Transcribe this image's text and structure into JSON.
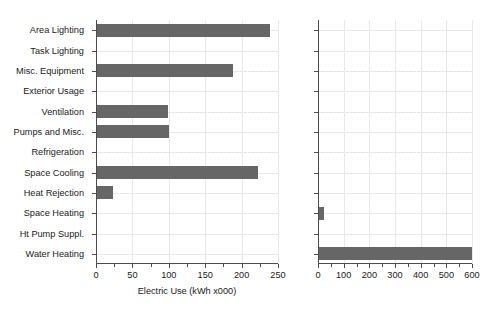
{
  "chart_data": [
    {
      "type": "bar",
      "orientation": "horizontal",
      "title": "",
      "xlabel": "Electric Use (kWh x000)",
      "ylabel": "",
      "categories": [
        "Area Lighting",
        "Task Lighting",
        "Misc. Equipment",
        "Exterior Usage",
        "Ventilation",
        "Pumps and Misc.",
        "Refrigeration",
        "Space Cooling",
        "Heat Rejection",
        "Space Heating",
        "Ht Pump Suppl.",
        "Water Heating"
      ],
      "values": [
        237,
        0,
        187,
        0,
        97,
        99,
        0,
        221,
        22,
        0,
        0,
        0
      ],
      "xlim": [
        0,
        250
      ],
      "xticks": [
        0,
        50,
        100,
        150,
        200,
        250
      ],
      "xtick_labels": [
        "0",
        "50",
        "100",
        "150",
        "200",
        "250"
      ],
      "minor_tick_step": 25,
      "grid": true,
      "bar_color": "#666666"
    },
    {
      "type": "bar",
      "orientation": "horizontal",
      "title": "",
      "xlabel": "Fuel Use (Btu x000,000)",
      "ylabel": "",
      "categories": [
        "Area Lighting",
        "Task Lighting",
        "Misc. Equipment",
        "Exterior Usage",
        "Ventilation",
        "Pumps and Misc.",
        "Refrigeration",
        "Space Cooling",
        "Heat Rejection",
        "Space Heating",
        "Ht Pump Suppl.",
        "Water Heating"
      ],
      "values": [
        0,
        0,
        0,
        0,
        0,
        0,
        0,
        0,
        0,
        20,
        0,
        597
      ],
      "xlim": [
        0,
        600
      ],
      "xticks": [
        0,
        100,
        200,
        300,
        400,
        500,
        600
      ],
      "xtick_labels": [
        "0",
        "100",
        "200",
        "300",
        "400",
        "500",
        "600"
      ],
      "minor_tick_step": 50,
      "grid": true,
      "bar_color": "#666666"
    }
  ],
  "figure": {
    "background": "#ffffff",
    "axis_color": "#4d4d4d",
    "text_color": "#1a1a1a",
    "grid_color": "#e8e8e8"
  }
}
